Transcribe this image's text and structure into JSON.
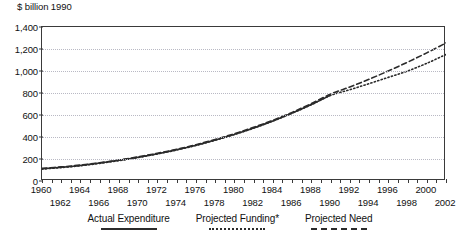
{
  "title_fragment": "y",
  "axis": {
    "y_unit_label": "$ billion 1990",
    "y_ticks": [
      "1,400",
      "1,200",
      "1,000",
      "800",
      "600",
      "400",
      "200",
      "0"
    ],
    "x_ticks_row_top": [
      "1960",
      "1964",
      "1968",
      "1972",
      "1976",
      "1980",
      "1984",
      "1988",
      "1992",
      "1996",
      "2000"
    ],
    "x_ticks_row_bottom": [
      "1962",
      "1966",
      "1970",
      "1974",
      "1978",
      "1982",
      "1986",
      "1990",
      "1994",
      "1998",
      "2002"
    ]
  },
  "legend": {
    "items": [
      {
        "label": "Actual Expenditure",
        "style": "solid",
        "color": "#2b2b2b"
      },
      {
        "label": "Projected Funding*",
        "style": "dotted",
        "color": "#2b2b2b"
      },
      {
        "label": "Projected Need",
        "style": "dashed",
        "color": "#2b2b2b"
      }
    ]
  },
  "chart_data": {
    "type": "line",
    "title": "",
    "xlabel": "",
    "ylabel": "$ billion 1990",
    "xlim": [
      1960,
      2002
    ],
    "ylim": [
      0,
      1400
    ],
    "ytick_values": [
      0,
      200,
      400,
      600,
      800,
      1000,
      1200,
      1400
    ],
    "xtick_values": [
      1960,
      1961,
      1962,
      1963,
      1964,
      1965,
      1966,
      1967,
      1968,
      1969,
      1970,
      1971,
      1972,
      1973,
      1974,
      1975,
      1976,
      1977,
      1978,
      1979,
      1980,
      1981,
      1982,
      1983,
      1984,
      1985,
      1986,
      1987,
      1988,
      1989,
      1990,
      1991,
      1992,
      1993,
      1994,
      1995,
      1996,
      1997,
      1998,
      1999,
      2000,
      2001,
      2002
    ],
    "grid": true,
    "legend_position": "bottom",
    "series": [
      {
        "name": "Actual Expenditure",
        "style": "solid",
        "color": "#2b2b2b",
        "x": [
          1960,
          1962,
          1964,
          1966,
          1968,
          1970,
          1972,
          1974,
          1976,
          1978,
          1980,
          1982,
          1984,
          1986,
          1988,
          1990
        ],
        "values": [
          112,
          125,
          142,
          163,
          188,
          216,
          248,
          284,
          325,
          372,
          424,
          482,
          546,
          617,
          695,
          780
        ]
      },
      {
        "name": "Projected Funding*",
        "style": "dotted",
        "color": "#2b2b2b",
        "x": [
          1960,
          1962,
          1964,
          1966,
          1968,
          1970,
          1972,
          1974,
          1976,
          1978,
          1980,
          1982,
          1984,
          1986,
          1988,
          1990,
          1992,
          1994,
          1996,
          1998,
          2000,
          2002
        ],
        "values": [
          108,
          122,
          139,
          160,
          185,
          213,
          246,
          282,
          323,
          370,
          422,
          480,
          545,
          616,
          694,
          778,
          830,
          885,
          942,
          1000,
          1070,
          1150
        ]
      },
      {
        "name": "Projected Need",
        "style": "dashed",
        "color": "#2b2b2b",
        "x": [
          1960,
          1962,
          1964,
          1966,
          1968,
          1970,
          1972,
          1974,
          1976,
          1978,
          1980,
          1982,
          1984,
          1986,
          1988,
          1990,
          1992,
          1994,
          1996,
          1998,
          2000,
          2002
        ],
        "values": [
          115,
          128,
          145,
          166,
          191,
          220,
          252,
          288,
          330,
          378,
          430,
          488,
          552,
          624,
          704,
          790,
          855,
          925,
          1000,
          1080,
          1165,
          1255
        ]
      }
    ]
  }
}
